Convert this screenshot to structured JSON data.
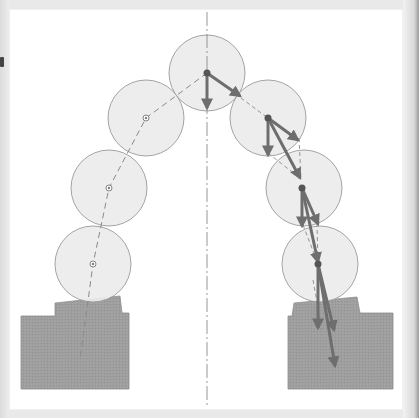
{
  "figure": {
    "type": "arch-thrust-line-diagram",
    "colors": {
      "background": "#e9e9e9",
      "panel": "#ffffff",
      "voussoir_fill": "#ececec",
      "voussoir_stroke": "#9a9a9a",
      "abutment_fill": "#9c9c9c",
      "axis_stroke": "#8a8a8a",
      "thrust_line": "#8f8f8f",
      "vector": "#6e6e6e"
    },
    "voussoirs": [
      {
        "id": "left-bottom",
        "cx": 94,
        "cy": 264,
        "r": 37
      },
      {
        "id": "left-mid",
        "cx": 110,
        "cy": 188,
        "r": 37
      },
      {
        "id": "left-upper",
        "cx": 146,
        "cy": 118,
        "r": 37
      },
      {
        "id": "crown",
        "cx": 207,
        "cy": 73,
        "r": 37
      },
      {
        "id": "right-upper",
        "cx": 268,
        "cy": 118,
        "r": 37
      },
      {
        "id": "right-mid",
        "cx": 304,
        "cy": 188,
        "r": 37
      },
      {
        "id": "right-bottom",
        "cx": 320,
        "cy": 264,
        "r": 37
      }
    ],
    "abutments": [
      {
        "id": "left-abutment",
        "label": "Left abutment"
      },
      {
        "id": "right-abutment",
        "label": "Right abutment"
      }
    ],
    "axis": {
      "label": "Symmetry axis",
      "x": 207
    },
    "thrust_line": {
      "label": "Thrust line",
      "side": "left"
    },
    "force_vectors": {
      "label": "Force vectors",
      "side": "right"
    }
  }
}
